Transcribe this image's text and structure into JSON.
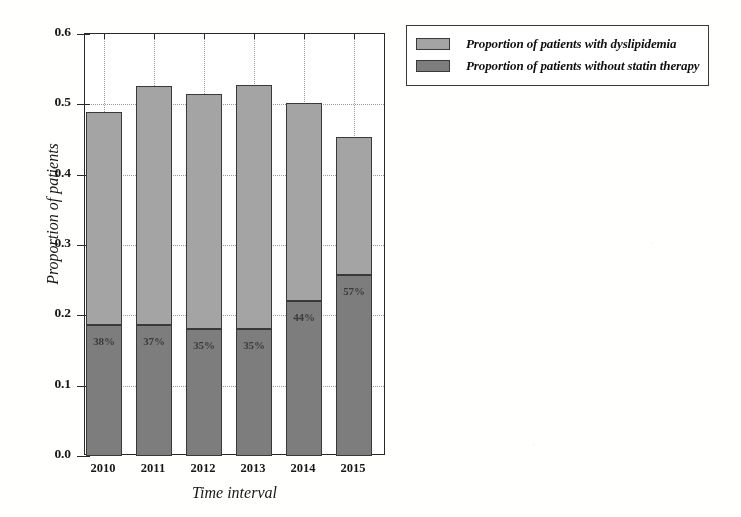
{
  "chart_data": {
    "type": "bar",
    "subtype": "stacked-bar",
    "title": "",
    "xlabel": "Time interval",
    "ylabel": "Proportion of patients",
    "categories": [
      "2010",
      "2011",
      "2012",
      "2013",
      "2014",
      "2015"
    ],
    "ylim": [
      0.0,
      0.6
    ],
    "xlim_note": "categorical, 6 intervals",
    "ytick_labels": [
      "0.0",
      "0.1",
      "0.2",
      "0.3",
      "0.4",
      "0.5",
      "0.6"
    ],
    "ytick_values": [
      0.0,
      0.1,
      0.2,
      0.3,
      0.4,
      0.5,
      0.6
    ],
    "grid": "dotted gridlines, both horizontal and vertical",
    "legend_position": "outside right, top",
    "series": [
      {
        "name": "Proportion of patients with dyslipidemia",
        "role": "total-bar-height",
        "color": "#a3a3a3",
        "values": [
          0.489,
          0.526,
          0.515,
          0.528,
          0.502,
          0.453
        ]
      },
      {
        "name": "Proportion of patients without statin therapy",
        "role": "lower-segment",
        "color": "#7d7d7d",
        "values": [
          0.186,
          0.186,
          0.181,
          0.181,
          0.221,
          0.258
        ]
      }
    ],
    "data_labels": [
      "38%",
      "37%",
      "35%",
      "35%",
      "44%",
      "57%"
    ],
    "data_labels_note": "percentage of dyslipidemia patients without statin therapy, drawn inside the lower (dark) segment"
  },
  "axes": {
    "y_title": "Proportion of patients",
    "x_title": "Time interval",
    "y_ticks": [
      "0.6",
      "0.5",
      "0.4",
      "0.3",
      "0.2",
      "0.1",
      "0.0"
    ],
    "x_ticks": [
      "2010",
      "2011",
      "2012",
      "2013",
      "2014",
      "2015"
    ]
  },
  "legend": {
    "items": [
      {
        "label": "Proportion of patients with dyslipidemia",
        "swatch": "#a3a3a3"
      },
      {
        "label": "Proportion of patients without statin therapy",
        "swatch": "#7d7d7d"
      }
    ]
  },
  "colors": {
    "upper_segment": "#a3a3a3",
    "lower_segment": "#7d7d7d",
    "bar_outline": "#3a3a3a",
    "axis": "#2b2b2b",
    "grid": "#9a9a9a",
    "background": "#fdfdfc"
  },
  "bar_labels": {
    "b0": "38%",
    "b1": "37%",
    "b2": "35%",
    "b3": "35%",
    "b4": "44%",
    "b5": "57%"
  }
}
